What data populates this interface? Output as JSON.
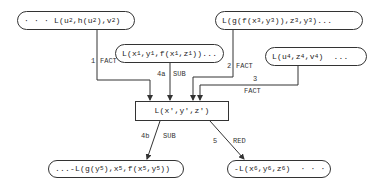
{
  "diagram": {
    "type": "inference-derivation-graph",
    "nodes": [
      {
        "id": "n1",
        "text": "· · · L(u2,h(u2),v2)",
        "shape": "pill"
      },
      {
        "id": "n2",
        "text": "L(x1,y1,f(x1,z1))...",
        "shape": "pill"
      },
      {
        "id": "n3",
        "text": "L(g(f(x3,y3)),z3,y3)...",
        "shape": "pill"
      },
      {
        "id": "n4",
        "text": "L(u4,z4,v4) ...",
        "shape": "pill"
      },
      {
        "id": "center",
        "text": "L(x',y',z')",
        "shape": "rectangle"
      },
      {
        "id": "n5",
        "text": "...-L(g(y5),x5,f(x5,y5))",
        "shape": "pill"
      },
      {
        "id": "n6",
        "text": "-L(x6,y6,z6) · · ·",
        "shape": "pill"
      }
    ],
    "edges": [
      {
        "from": "n1",
        "to": "center",
        "step": "1",
        "rule": "FACT"
      },
      {
        "from": "n2",
        "to": "center",
        "step": "4a",
        "rule": "SUB"
      },
      {
        "from": "n3",
        "to": "center",
        "step": "2",
        "rule": "FACT"
      },
      {
        "from": "n4",
        "to": "center",
        "step": "3",
        "rule": "FACT"
      },
      {
        "from": "center",
        "to": "n5",
        "step": "4b",
        "rule": "SUB"
      },
      {
        "from": "center",
        "to": "n6",
        "step": "5",
        "rule": "RED"
      }
    ]
  },
  "labels": {
    "e1_step": "1",
    "e1_rule": "FACT",
    "e2_step": "4a",
    "e2_rule": "SUB",
    "e3_step": "2",
    "e3_rule": "FACT",
    "e4_step": "3",
    "e4_rule": "FACT",
    "e5_step": "4b",
    "e5_rule": "SUB",
    "e6_step": "5",
    "e6_rule": "RED"
  },
  "node_text": {
    "n1": {
      "a": "· · · L(u",
      "s1": "2",
      "b": ",h(u",
      "s2": "2",
      "c": "),v",
      "s3": "2",
      "d": ")"
    },
    "n2": {
      "a": "L(x",
      "s1": "1",
      "b": ",y",
      "s2": "1",
      "c": ",f(x",
      "s3": "1",
      "d": ",z",
      "s4": "1",
      "e": "))..."
    },
    "n3": {
      "a": "L(g(f(x",
      "s1": "3",
      "b": ",y",
      "s2": "3",
      "c": ")),z",
      "s3": "3",
      "d": ",y",
      "s4": "3",
      "e": ")..."
    },
    "n4": {
      "a": "L(u",
      "s1": "4",
      "b": ",z",
      "s2": "4",
      "c": ",v",
      "s3": "4",
      "d": ")  ..."
    },
    "center": {
      "text": "L(x',y',z')"
    },
    "n5": {
      "a": "...-L(g(y",
      "s1": "5",
      "b": "),x",
      "s2": "5",
      "c": ",f(x",
      "s3": "5",
      "d": ",y",
      "s4": "5",
      "e": "))"
    },
    "n6": {
      "a": "-L(x",
      "s1": "6",
      "b": ",y",
      "s2": "6",
      "c": ",z",
      "s3": "6",
      "d": ")  · · ·"
    }
  }
}
